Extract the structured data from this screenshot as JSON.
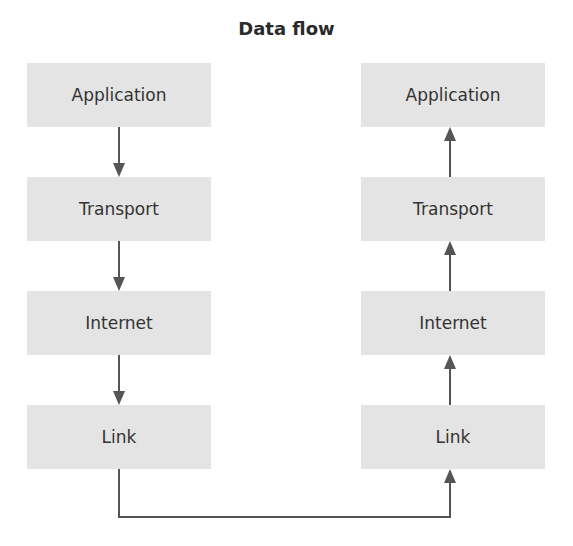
{
  "title": "Data flow",
  "left_stack": {
    "layers": [
      "Application",
      "Transport",
      "Internet",
      "Link"
    ],
    "direction": "down"
  },
  "right_stack": {
    "layers": [
      "Application",
      "Transport",
      "Internet",
      "Link"
    ],
    "direction": "up"
  },
  "colors": {
    "box": "#e4e4e4",
    "arrow": "#555555",
    "text": "#333333"
  }
}
